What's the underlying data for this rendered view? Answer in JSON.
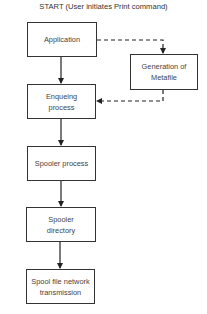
{
  "title": "START (User initiates Print command)",
  "nodes": {
    "application": "Application",
    "metafile": "Generation of Metafile",
    "enqueing": "Enqueing process",
    "spooler_process": "Spooler process",
    "spooler_directory": "Spooler directory",
    "spool_transmission": "Spool file network transmission"
  },
  "edges": [
    {
      "from": "Application",
      "to": "Enqueing process",
      "style": "solid"
    },
    {
      "from": "Application",
      "to": "Generation of Metafile",
      "style": "dashed"
    },
    {
      "from": "Generation of Metafile",
      "to": "Enqueing process",
      "style": "dashed"
    },
    {
      "from": "Enqueing process",
      "to": "Spooler process",
      "style": "solid"
    },
    {
      "from": "Spooler process",
      "to": "Spooler directory",
      "style": "solid"
    },
    {
      "from": "Spooler directory",
      "to": "Spool file network transmission",
      "style": "solid"
    }
  ],
  "colors": {
    "stroke": "#333333",
    "background": "#ffffff"
  }
}
